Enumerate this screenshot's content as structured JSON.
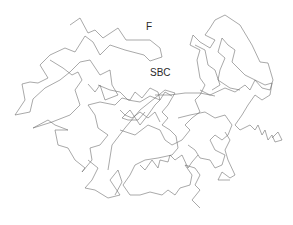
{
  "figure": {
    "type": "protein-backbone-trace",
    "stroke_color": "#6e6e6e",
    "background": "#ffffff",
    "labels": {
      "f": "F",
      "sbc": "SBC"
    },
    "chains": [
      [
        [
          70,
          25
        ],
        [
          80,
          18
        ],
        [
          88,
          33
        ],
        [
          95,
          30
        ],
        [
          103,
          38
        ],
        [
          118,
          28
        ],
        [
          126,
          40
        ],
        [
          150,
          40
        ],
        [
          160,
          48
        ],
        [
          162,
          57
        ],
        [
          150,
          61
        ],
        [
          144,
          55
        ],
        [
          125,
          50
        ],
        [
          110,
          45
        ],
        [
          100,
          55
        ],
        [
          93,
          42
        ],
        [
          85,
          36
        ],
        [
          75,
          52
        ],
        [
          65,
          48
        ],
        [
          50,
          55
        ],
        [
          40,
          65
        ],
        [
          48,
          78
        ],
        [
          38,
          83
        ],
        [
          30,
          82
        ],
        [
          22,
          84
        ],
        [
          25,
          100
        ],
        [
          15,
          115
        ],
        [
          30,
          112
        ],
        [
          33,
          99
        ],
        [
          45,
          88
        ],
        [
          60,
          80
        ],
        [
          70,
          72
        ],
        [
          80,
          62
        ],
        [
          90,
          60
        ],
        [
          100,
          75
        ],
        [
          110,
          70
        ],
        [
          112,
          85
        ],
        [
          118,
          95
        ],
        [
          105,
          100
        ],
        [
          100,
          85
        ],
        [
          95,
          92
        ],
        [
          88,
          84
        ]
      ],
      [
        [
          50,
          60
        ],
        [
          63,
          68
        ],
        [
          72,
          75
        ],
        [
          78,
          72
        ],
        [
          82,
          80
        ],
        [
          75,
          90
        ],
        [
          80,
          105
        ],
        [
          70,
          115
        ],
        [
          52,
          122
        ],
        [
          33,
          128
        ],
        [
          48,
          120
        ],
        [
          55,
          125
        ],
        [
          68,
          130
        ],
        [
          55,
          130
        ],
        [
          58,
          145
        ],
        [
          68,
          148
        ],
        [
          75,
          160
        ],
        [
          85,
          168
        ],
        [
          82,
          172
        ],
        [
          92,
          160
        ],
        [
          90,
          148
        ],
        [
          100,
          145
        ],
        [
          108,
          135
        ],
        [
          98,
          128
        ],
        [
          95,
          115
        ],
        [
          88,
          105
        ],
        [
          100,
          102
        ],
        [
          115,
          105
        ],
        [
          122,
          98
        ],
        [
          130,
          100
        ],
        [
          135,
          92
        ],
        [
          142,
          98
        ],
        [
          150,
          88
        ],
        [
          158,
          92
        ],
        [
          160,
          100
        ],
        [
          155,
          105
        ],
        [
          148,
          115
        ],
        [
          140,
          125
        ],
        [
          130,
          110
        ],
        [
          122,
          118
        ],
        [
          128,
          120
        ],
        [
          138,
          120
        ],
        [
          145,
          112
        ]
      ],
      [
        [
          88,
          160
        ],
        [
          98,
          168
        ],
        [
          92,
          180
        ],
        [
          85,
          188
        ],
        [
          95,
          190
        ],
        [
          108,
          198
        ],
        [
          120,
          195
        ],
        [
          110,
          180
        ],
        [
          118,
          170
        ],
        [
          122,
          182
        ],
        [
          115,
          195
        ]
      ],
      [
        [
          108,
          170
        ],
        [
          112,
          145
        ],
        [
          125,
          128
        ],
        [
          140,
          110
        ],
        [
          155,
          98
        ],
        [
          165,
          90
        ],
        [
          175,
          93
        ],
        [
          172,
          98
        ],
        [
          168,
          105
        ],
        [
          162,
          112
        ],
        [
          168,
          118
        ],
        [
          162,
          125
        ],
        [
          170,
          130
        ],
        [
          176,
          136
        ],
        [
          178,
          148
        ],
        [
          172,
          155
        ],
        [
          158,
          158
        ],
        [
          145,
          160
        ],
        [
          135,
          165
        ],
        [
          130,
          175
        ],
        [
          123,
          185
        ],
        [
          130,
          195
        ],
        [
          140,
          195
        ],
        [
          150,
          192
        ],
        [
          162,
          195
        ],
        [
          168,
          190
        ],
        [
          175,
          195
        ],
        [
          180,
          188
        ],
        [
          190,
          185
        ],
        [
          192,
          175
        ],
        [
          185,
          165
        ],
        [
          195,
          168
        ],
        [
          200,
          175
        ],
        [
          195,
          185
        ],
        [
          200,
          190
        ],
        [
          192,
          200
        ],
        [
          200,
          208
        ]
      ],
      [
        [
          140,
          165
        ],
        [
          145,
          170
        ],
        [
          152,
          160
        ],
        [
          158,
          168
        ],
        [
          160,
          160
        ],
        [
          168,
          162
        ],
        [
          170,
          155
        ],
        [
          175,
          160
        ],
        [
          182,
          155
        ],
        [
          188,
          168
        ],
        [
          192,
          162
        ],
        [
          198,
          155
        ]
      ],
      [
        [
          120,
          130
        ],
        [
          135,
          135
        ],
        [
          148,
          125
        ],
        [
          160,
          130
        ],
        [
          165,
          140
        ],
        [
          172,
          145
        ],
        [
          182,
          140
        ],
        [
          190,
          130
        ],
        [
          185,
          125
        ],
        [
          192,
          118
        ],
        [
          200,
          112
        ],
        [
          195,
          100
        ],
        [
          200,
          95
        ],
        [
          205,
          85
        ],
        [
          200,
          78
        ],
        [
          197,
          60
        ],
        [
          200,
          50
        ],
        [
          190,
          45
        ],
        [
          193,
          35
        ],
        [
          200,
          42
        ],
        [
          210,
          48
        ],
        [
          215,
          40
        ],
        [
          205,
          35
        ],
        [
          210,
          28
        ],
        [
          215,
          20
        ],
        [
          225,
          15
        ],
        [
          240,
          25
        ],
        [
          252,
          45
        ],
        [
          260,
          62
        ],
        [
          268,
          63
        ],
        [
          273,
          80
        ],
        [
          270,
          90
        ],
        [
          262,
          88
        ],
        [
          255,
          80
        ],
        [
          245,
          75
        ],
        [
          238,
          68
        ],
        [
          232,
          62
        ],
        [
          235,
          50
        ],
        [
          228,
          45
        ],
        [
          222,
          38
        ],
        [
          218,
          52
        ],
        [
          225,
          58
        ],
        [
          220,
          70
        ],
        [
          218,
          80
        ],
        [
          230,
          88
        ],
        [
          240,
          90
        ]
      ],
      [
        [
          200,
          90
        ],
        [
          210,
          95
        ],
        [
          225,
          88
        ],
        [
          235,
          92
        ],
        [
          245,
          85
        ],
        [
          250,
          90
        ],
        [
          255,
          80
        ],
        [
          265,
          85
        ],
        [
          272,
          83
        ],
        [
          270,
          95
        ],
        [
          262,
          100
        ],
        [
          255,
          95
        ],
        [
          248,
          105
        ],
        [
          242,
          115
        ],
        [
          235,
          125
        ],
        [
          240,
          130
        ],
        [
          250,
          125
        ],
        [
          255,
          130
        ],
        [
          258,
          125
        ],
        [
          262,
          135
        ],
        [
          265,
          130
        ],
        [
          268,
          140
        ],
        [
          272,
          135
        ],
        [
          275,
          142
        ],
        [
          282,
          140
        ],
        [
          278,
          132
        ],
        [
          272,
          138
        ]
      ],
      [
        [
          178,
          118
        ],
        [
          190,
          115
        ],
        [
          205,
          112
        ],
        [
          215,
          118
        ],
        [
          225,
          115
        ],
        [
          232,
          125
        ],
        [
          228,
          135
        ],
        [
          222,
          140
        ],
        [
          215,
          135
        ],
        [
          210,
          140
        ],
        [
          215,
          150
        ],
        [
          225,
          155
        ],
        [
          222,
          165
        ],
        [
          215,
          168
        ],
        [
          210,
          160
        ],
        [
          200,
          158
        ],
        [
          195,
          150
        ],
        [
          188,
          145
        ]
      ],
      [
        [
          225,
          132
        ],
        [
          230,
          140
        ],
        [
          225,
          150
        ],
        [
          228,
          160
        ],
        [
          235,
          175
        ],
        [
          230,
          178
        ],
        [
          222,
          172
        ],
        [
          218,
          180
        ],
        [
          230,
          180
        ]
      ],
      [
        [
          155,
          95
        ],
        [
          170,
          95
        ],
        [
          185,
          93
        ],
        [
          200,
          93
        ],
        [
          215,
          96
        ]
      ],
      [
        [
          98,
          85
        ],
        [
          110,
          90
        ],
        [
          120,
          92
        ],
        [
          128,
          100
        ],
        [
          140,
          102
        ],
        [
          150,
          96
        ],
        [
          160,
          100
        ],
        [
          165,
          92
        ],
        [
          172,
          96
        ]
      ],
      [
        [
          120,
          110
        ],
        [
          125,
          115
        ],
        [
          132,
          118
        ],
        [
          140,
          112
        ],
        [
          148,
          118
        ],
        [
          155,
          112
        ],
        [
          160,
          122
        ]
      ],
      [
        [
          195,
          45
        ],
        [
          205,
          50
        ],
        [
          208,
          65
        ],
        [
          215,
          70
        ],
        [
          220,
          85
        ],
        [
          212,
          90
        ]
      ]
    ]
  }
}
